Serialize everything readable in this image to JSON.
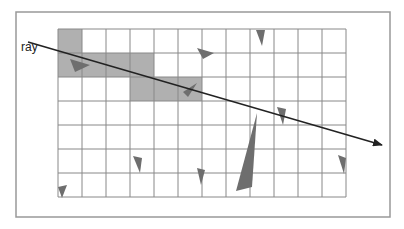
{
  "figure": {
    "ray_label": "ray",
    "colors": {
      "frame": "#999999",
      "grid_line": "#888888",
      "cell_fill": "#b0b0b0",
      "triangle_fill": "#6e6e6e",
      "ray": "#222222"
    },
    "frame": {
      "x": 16,
      "y": 12,
      "w": 374,
      "h": 205
    },
    "grid": {
      "x": 58,
      "y": 29,
      "cols": 12,
      "rows": 7,
      "cell": 24
    },
    "shaded_cells": [
      {
        "row": 0,
        "col": 0
      },
      {
        "row": 1,
        "col": 0
      },
      {
        "row": 1,
        "col": 1
      },
      {
        "row": 1,
        "col": 2
      },
      {
        "row": 1,
        "col": 3
      },
      {
        "row": 2,
        "col": 3
      },
      {
        "row": 2,
        "col": 4
      },
      {
        "row": 2,
        "col": 5
      }
    ],
    "ray": {
      "x1": 28,
      "y1": 42,
      "x2": 382,
      "y2": 145
    },
    "triangles": [
      "70,59 90,65 75,72",
      "197,48 214,53 203,59",
      "256,30 265,30 262,46",
      "183,92 197,83 188,97",
      "257,113 236,191 252,187",
      "277,107 286,109 283,125",
      "133,156 142,158 140,173",
      "197,168 205,170 201,185",
      "338,155 346,158 344,174",
      "58,187 67,185 62,198"
    ]
  }
}
